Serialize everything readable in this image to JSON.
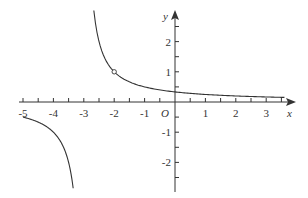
{
  "chart_data": {
    "type": "line",
    "title": "",
    "function": "y = 1/(x+3), x ≠ -2",
    "xlabel": "x",
    "ylabel": "y",
    "origin_label": "O",
    "xlim": [
      -5,
      3.6
    ],
    "ylim": [
      -2.9,
      3.1
    ],
    "grid": false,
    "legend": null,
    "x_ticks": [
      -5,
      -4,
      -3,
      -2,
      -1,
      1,
      2,
      3
    ],
    "x_tick_labels": [
      "-5",
      "-4",
      "-3",
      "-2",
      "-1",
      "1",
      "2",
      "3"
    ],
    "y_ticks": [
      -2,
      -1,
      1,
      2
    ],
    "y_tick_labels": [
      "-2",
      "-1",
      "1",
      "2"
    ],
    "minor_tick_step": 0.5,
    "vertical_asymptote": -3,
    "horizontal_asymptote": 0,
    "open_point": {
      "x": -2,
      "y": 1
    },
    "series": [
      {
        "name": "left-branch",
        "x_range": [
          -5,
          -3.35
        ],
        "points": [
          [
            -5,
            -0.5
          ],
          [
            -4.5,
            -0.667
          ],
          [
            -4,
            -1
          ],
          [
            -3.7,
            -1.43
          ],
          [
            -3.5,
            -2
          ],
          [
            -3.35,
            -2.86
          ]
        ]
      },
      {
        "name": "right-branch",
        "x_range": [
          -2.67,
          3.6
        ],
        "points": [
          [
            -2.67,
            3.0
          ],
          [
            -2.5,
            2
          ],
          [
            -2,
            1
          ],
          [
            -1,
            0.5
          ],
          [
            0,
            0.333
          ],
          [
            1,
            0.25
          ],
          [
            2,
            0.2
          ],
          [
            3,
            0.167
          ],
          [
            3.6,
            0.152
          ]
        ]
      }
    ]
  },
  "layout": {
    "origin_px": [
      175,
      102
    ],
    "unit_x_px": 30.4,
    "unit_y_px": 30.2,
    "stroke_color": "#333333"
  }
}
